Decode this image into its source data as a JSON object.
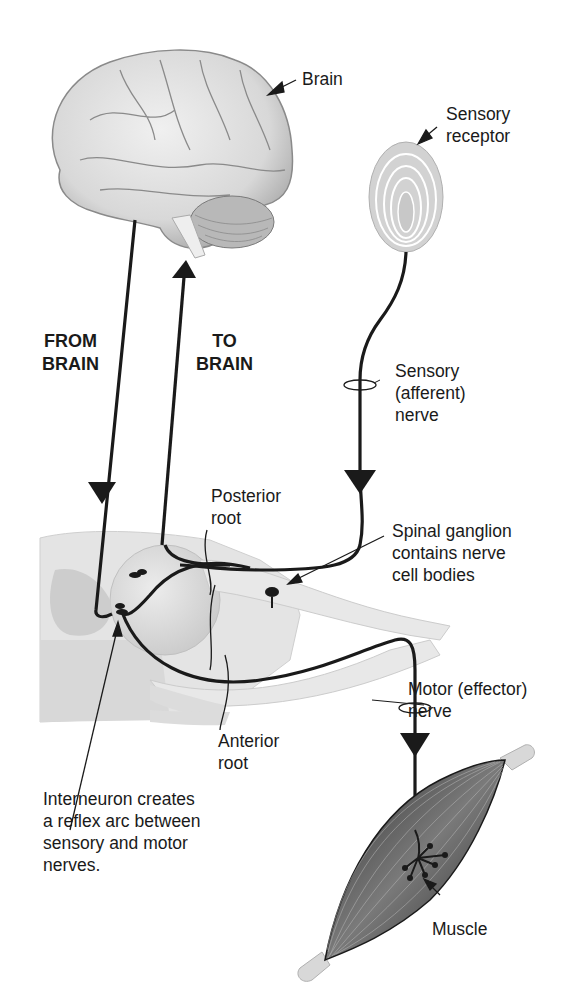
{
  "diagram": {
    "type": "reflex arc illustration",
    "colors": {
      "nerve": "#1a1a1a",
      "brain": "#d9d9d9",
      "spinal_cord": "#e2e2e2",
      "muscle": "#4a4a4a",
      "tendon": "#d8d8d8",
      "receptor": "#cfcfcf"
    },
    "labels": {
      "brain": "Brain",
      "sensory_receptor": {
        "line1": "Sensory",
        "line2": "receptor"
      },
      "from_brain": {
        "line1": "FROM",
        "line2": "BRAIN"
      },
      "to_brain": {
        "line1": "TO",
        "line2": "BRAIN"
      },
      "sensory_nerve": {
        "line1": "Sensory",
        "line2": "(afferent)",
        "line3": "nerve"
      },
      "posterior_root": {
        "line1": "Posterior",
        "line2": "root"
      },
      "spinal_ganglion": {
        "line1": "Spinal ganglion",
        "line2": "contains nerve",
        "line3": "cell bodies"
      },
      "motor_nerve": {
        "line1": "Motor (effector)",
        "line2": "nerve"
      },
      "anterior_root": {
        "line1": "Anterior",
        "line2": "root"
      },
      "interneuron": {
        "line1": "Interneuron creates",
        "line2": "a reflex arc between",
        "line3": "sensory and motor",
        "line4": "nerves."
      },
      "muscle": "Muscle"
    }
  }
}
